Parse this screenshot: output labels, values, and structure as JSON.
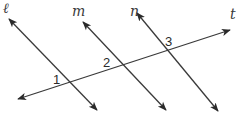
{
  "diagram": {
    "lines": [
      {
        "id": "l",
        "label": "ℓ",
        "x1": 97,
        "y1": 110,
        "x2": 9,
        "y2": 19,
        "label_x": 3,
        "label_y": 13
      },
      {
        "id": "m",
        "label": "m",
        "x1": 166,
        "y1": 110,
        "x2": 83,
        "y2": 22,
        "label_x": 72,
        "label_y": 16
      },
      {
        "id": "n",
        "label": "n",
        "x1": 218,
        "y1": 111,
        "x2": 137,
        "y2": 13,
        "label_x": 130,
        "label_y": 16
      },
      {
        "id": "t",
        "label": "t",
        "x1": 18,
        "y1": 99,
        "x2": 230,
        "y2": 30,
        "label_x": 230,
        "label_y": 19
      }
    ],
    "angles": [
      {
        "label": "1",
        "x": 53,
        "y": 84
      },
      {
        "label": "2",
        "x": 103,
        "y": 67
      },
      {
        "label": "3",
        "x": 165,
        "y": 46
      }
    ],
    "colors": {
      "line": "#3a3a3a",
      "background": "#ffffff"
    }
  }
}
